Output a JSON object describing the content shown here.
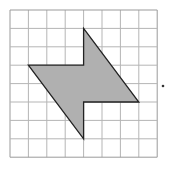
{
  "diagram": {
    "type": "grid-figure",
    "grid": {
      "rows": 8,
      "cols": 8,
      "origin_px": [
        10,
        10
      ],
      "cell_px": 18.4,
      "line_color": "#b5b5b5",
      "border_color": "#9a9a9a"
    },
    "shape": {
      "vertices_grid": [
        [
          4,
          1
        ],
        [
          7,
          5
        ],
        [
          4,
          5
        ],
        [
          4,
          7
        ],
        [
          1,
          3
        ],
        [
          4,
          3
        ]
      ],
      "fill": "#b0b0b0",
      "stroke": "#222222"
    },
    "marker": {
      "label": ".",
      "position_px": [
        163,
        86
      ]
    }
  }
}
